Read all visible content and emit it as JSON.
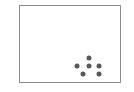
{
  "figure": {
    "background_color": "#ffffff",
    "panel": {
      "border_color": "#8c8c8c",
      "fill_color": "#ffffff",
      "x": 19,
      "y": 5,
      "width": 102,
      "height": 78
    },
    "title": "",
    "xlabel": "",
    "ylabel": ""
  },
  "chart_data": {
    "type": "scatter",
    "title": "",
    "xlabel": "",
    "ylabel": "",
    "grid": false,
    "legend": null,
    "legend_position": "none",
    "xlim": [
      0,
      100
    ],
    "ylim": [
      0,
      100
    ],
    "xticks": [],
    "yticks": [],
    "xticklabels": [],
    "yticklabels": [],
    "marker": "circle",
    "marker_color": "#595959",
    "marker_size_px": 5,
    "n_points": 6,
    "series": [
      {
        "name": "points",
        "color": "#595959",
        "x": [
          68.5,
          56.5,
          68.5,
          78.5,
          62.5,
          78.5
        ],
        "y": [
          34.0,
          24.0,
          24.0,
          24.0,
          13.5,
          13.5
        ]
      }
    ],
    "points_px": [
      {
        "label": "point-1",
        "cx": 69,
        "cy": 52
      },
      {
        "label": "point-2",
        "cx": 57,
        "cy": 60
      },
      {
        "label": "point-3",
        "cx": 69,
        "cy": 60
      },
      {
        "label": "point-4",
        "cx": 79,
        "cy": 60
      },
      {
        "label": "point-5",
        "cx": 63,
        "cy": 68
      },
      {
        "label": "point-6",
        "cx": 79,
        "cy": 68
      }
    ]
  }
}
